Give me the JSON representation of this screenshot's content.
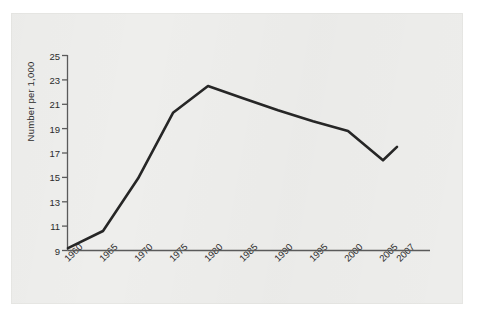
{
  "figure": {
    "background_color": "#eeeeec",
    "line_color": "#262626",
    "axis_color": "#5a5a5a",
    "text_color": "#2b2b2b"
  },
  "axis": {
    "y_title": "Number per 1,000",
    "y_ticks": [
      "25",
      "23",
      "21",
      "19",
      "17",
      "15",
      "13",
      "11",
      "9"
    ],
    "x_ticks": [
      "1960",
      "1965",
      "1970",
      "1975",
      "1980",
      "1985",
      "1990",
      "1995",
      "2000",
      "2005",
      "2007"
    ]
  },
  "chart_data": {
    "type": "line",
    "title": "",
    "xlabel": "",
    "ylabel": "Number per 1,000",
    "categories": [
      "1960",
      "1965",
      "1970",
      "1975",
      "1980",
      "1985",
      "1990",
      "1995",
      "2000",
      "2005",
      "2007"
    ],
    "x": [
      1960,
      1965,
      1970,
      1975,
      1980,
      1985,
      1990,
      1995,
      2000,
      2005,
      2007
    ],
    "values": [
      9.2,
      10.6,
      14.9,
      20.3,
      22.5,
      21.5,
      20.5,
      19.6,
      18.8,
      16.4,
      17.5
    ],
    "series": [
      {
        "name": "Number per 1,000",
        "values": [
          9.2,
          10.6,
          14.9,
          20.3,
          22.5,
          21.5,
          20.5,
          19.6,
          18.8,
          16.4,
          17.5
        ]
      }
    ],
    "ylim": [
      9,
      25
    ],
    "ytick_step": 2,
    "grid": false,
    "legend": "none",
    "markers": false,
    "peak": {
      "x": "1980",
      "y": 22.5
    },
    "minimum": {
      "x": "1960",
      "y": 9.2
    }
  }
}
